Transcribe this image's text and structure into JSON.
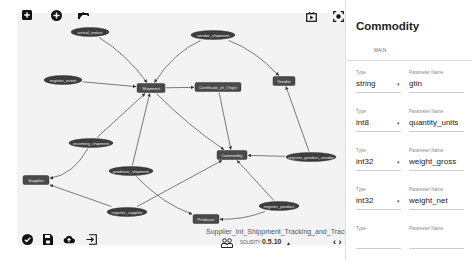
{
  "toolbar_top": {
    "icons": [
      "add-square-icon",
      "add-circle-icon",
      "undo-arrow-icon"
    ],
    "right_icons": [
      "play-box-icon",
      "focus-icon"
    ]
  },
  "toolbar_bottom": {
    "icons": [
      "check-circle-icon",
      "save-icon",
      "cloud-upload-icon",
      "export-icon"
    ]
  },
  "graph": {
    "nodes": [
      {
        "id": "arrival_notice",
        "label": "arrival_notice",
        "shape": "ellipse"
      },
      {
        "id": "vendor_shipment",
        "label": "vendor_shipment",
        "shape": "ellipse"
      },
      {
        "id": "register_event",
        "label": "register_event",
        "shape": "ellipse"
      },
      {
        "id": "Shipment",
        "label": "Shipment",
        "shape": "rect"
      },
      {
        "id": "Certificate_of_Origin",
        "label": "Certificate_of_Origin",
        "shape": "rect"
      },
      {
        "id": "Vendor",
        "label": "Vendor",
        "shape": "rect"
      },
      {
        "id": "incoming_shipment",
        "label": "incoming_shipment",
        "shape": "ellipse"
      },
      {
        "id": "Commodity",
        "label": "Commodity",
        "shape": "rect"
      },
      {
        "id": "register_product_vendor",
        "label": "register_product_vendor",
        "shape": "ellipse"
      },
      {
        "id": "Supplier",
        "label": "Supplier",
        "shape": "rect"
      },
      {
        "id": "producer_shipment",
        "label": "producer_shipment",
        "shape": "ellipse"
      },
      {
        "id": "register_supplier",
        "label": "register_supplier",
        "shape": "ellipse"
      },
      {
        "id": "register_product",
        "label": "register_product",
        "shape": "ellipse"
      },
      {
        "id": "Producer",
        "label": "Producer",
        "shape": "rect"
      }
    ],
    "edges": [
      [
        "arrival_notice",
        "Shipment"
      ],
      [
        "vendor_shipment",
        "Shipment"
      ],
      [
        "vendor_shipment",
        "Vendor"
      ],
      [
        "register_event",
        "Shipment"
      ],
      [
        "Shipment",
        "Certificate_of_Origin"
      ],
      [
        "Shipment",
        "Commodity"
      ],
      [
        "Certificate_of_Origin",
        "Commodity"
      ],
      [
        "incoming_shipment",
        "Shipment"
      ],
      [
        "incoming_shipment",
        "Supplier"
      ],
      [
        "producer_shipment",
        "Shipment"
      ],
      [
        "producer_shipment",
        "Producer"
      ],
      [
        "register_product_vendor",
        "Vendor"
      ],
      [
        "register_product_vendor",
        "Commodity"
      ],
      [
        "register_supplier",
        "Supplier"
      ],
      [
        "register_supplier",
        "Commodity"
      ],
      [
        "register_product",
        "Commodity"
      ],
      [
        "register_product",
        "Producer"
      ]
    ]
  },
  "footer": {
    "project_name": "Supplier_Int_Shippment_Tracking_and_Tracing_",
    "people_icon": "people-icon",
    "solidity_label": "SOLIDITY:",
    "solidity_version": "0.5.10",
    "version_caret": "▲",
    "code_icon": "‹ ›"
  },
  "panel": {
    "title": "Commodity",
    "tab": "MAIN",
    "type_label": "Type",
    "param_label": "Parameter Name",
    "params": [
      {
        "type": "string",
        "name": "gtin"
      },
      {
        "type": "int8",
        "name": "quantity_units"
      },
      {
        "type": "int32",
        "name": "weight_gross"
      },
      {
        "type": "int32",
        "name": "weight_net"
      },
      {
        "type": "",
        "name": ""
      }
    ]
  }
}
